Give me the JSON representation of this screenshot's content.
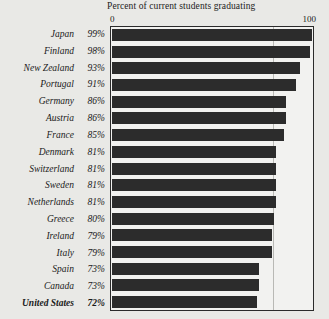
{
  "chart_data": {
    "type": "bar",
    "orientation": "horizontal",
    "title": "Percent of current students graduating",
    "xlabel": "",
    "ylabel": "",
    "xlim": [
      0,
      100
    ],
    "tick_labels": [
      "0",
      "100"
    ],
    "grid": true,
    "gridlines": [
      80
    ],
    "legend": null,
    "value_suffix": "%",
    "bar_color": "#2c2c2c",
    "categories": [
      "Japan",
      "Finland",
      "New Zealand",
      "Portugal",
      "Germany",
      "Austria",
      "France",
      "Denmark",
      "Switzerland",
      "Sweden",
      "Netherlands",
      "Greece",
      "Ireland",
      "Italy",
      "Spain",
      "Canada",
      "United States"
    ],
    "values": [
      99,
      98,
      93,
      91,
      86,
      86,
      85,
      81,
      81,
      81,
      81,
      80,
      79,
      79,
      73,
      73,
      72
    ],
    "value_labels": [
      "99%",
      "98%",
      "93%",
      "91%",
      "86%",
      "86%",
      "85%",
      "81%",
      "81%",
      "81%",
      "81%",
      "80%",
      "79%",
      "79%",
      "73%",
      "73%",
      "72%"
    ],
    "highlighted_category": "United States"
  }
}
